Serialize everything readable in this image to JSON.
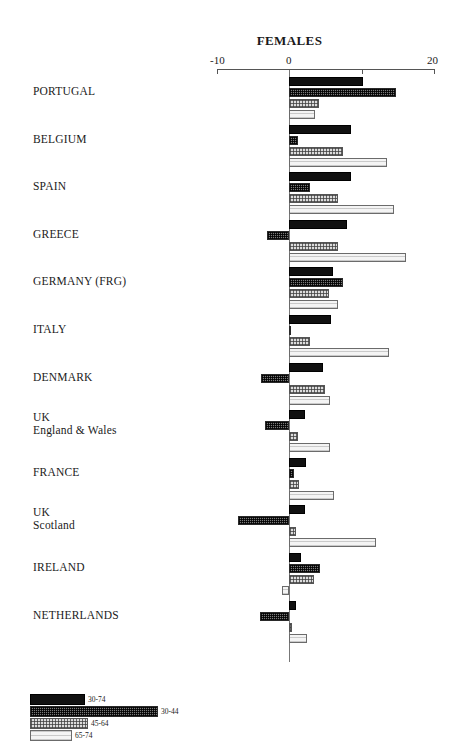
{
  "chart_data": {
    "type": "bar",
    "orientation": "horizontal",
    "title": "FEMALES",
    "xlabel": "",
    "ylabel": "",
    "xlim": [
      -10,
      20
    ],
    "xticks": [
      -10,
      0,
      10,
      20
    ],
    "xtick_labels": [
      "-10",
      "0",
      "",
      "20"
    ],
    "grid": false,
    "legend_position": "bottom-left",
    "categories": [
      "PORTUGAL",
      "BELGIUM",
      "SPAIN",
      "GREECE",
      "GERMANY (FRG)",
      "ITALY",
      "DENMARK",
      "UK\nEngland & Wales",
      "FRANCE",
      "UK\nScotland",
      "IRELAND",
      "NETHERLANDS"
    ],
    "series": [
      {
        "name": "30-74",
        "pattern": "solid-black",
        "values": [
          10.2,
          8.6,
          8.6,
          8.0,
          6.0,
          5.8,
          4.7,
          2.2,
          2.4,
          2.2,
          1.6,
          0.9
        ]
      },
      {
        "name": "30-44",
        "pattern": "dense-checker",
        "values": [
          14.8,
          1.3,
          2.9,
          -3.0,
          7.5,
          0.1,
          -3.9,
          -3.3,
          0.7,
          -7.0,
          4.3,
          -4.0
        ]
      },
      {
        "name": "45-64",
        "pattern": "light-checker",
        "values": [
          4.1,
          7.4,
          6.7,
          6.7,
          5.5,
          2.9,
          5.0,
          1.3,
          1.4,
          0.9,
          3.5,
          0.4
        ]
      },
      {
        "name": "65-74",
        "pattern": "fine-hatch",
        "values": [
          3.6,
          13.5,
          14.5,
          16.1,
          6.8,
          13.8,
          5.6,
          5.6,
          6.2,
          12.0,
          -0.9,
          2.5
        ]
      }
    ]
  },
  "legend": {
    "items": [
      {
        "label": "30-74",
        "pattern": "solid-black"
      },
      {
        "label": "30-44",
        "pattern": "dense-checker"
      },
      {
        "label": "45-64",
        "pattern": "light-checker"
      },
      {
        "label": "65-74",
        "pattern": "fine-hatch"
      }
    ]
  },
  "axis": {
    "tick_minus10": "-10",
    "tick_zero": "0",
    "tick_twenty": "20"
  }
}
